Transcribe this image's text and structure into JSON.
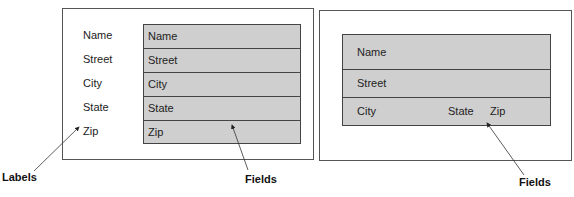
{
  "left_form": {
    "labels": [
      "Name",
      "Street",
      "City",
      "State",
      "Zip"
    ],
    "fields": [
      "Name",
      "Street",
      "City",
      "State",
      "Zip"
    ]
  },
  "right_form": {
    "rows": [
      {
        "items": [
          "Name"
        ]
      },
      {
        "items": [
          "Street"
        ]
      },
      {
        "items": [
          "City",
          "State",
          "Zip"
        ]
      }
    ]
  },
  "callouts": {
    "labels": "Labels",
    "fields_left": "Fields",
    "fields_right": "Fields"
  },
  "colors": {
    "field_fill": "#cfcfcf",
    "border": "#444444"
  }
}
